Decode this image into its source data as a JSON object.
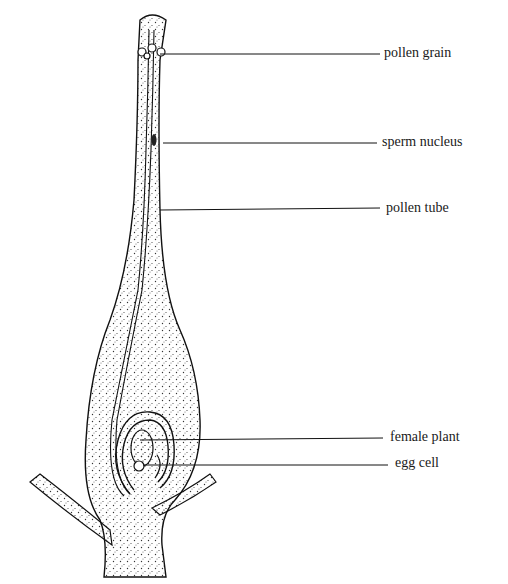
{
  "diagram": {
    "labels": [
      {
        "id": "pollen-grain",
        "text": "pollen grain",
        "x": 384,
        "y": 45,
        "line_from": [
          160,
          54
        ],
        "line_to": [
          380,
          54
        ]
      },
      {
        "id": "sperm-nucleus",
        "text": "sperm nucleus",
        "x": 382,
        "y": 134,
        "line_from": [
          163,
          143
        ],
        "line_to": [
          377,
          143
        ]
      },
      {
        "id": "pollen-tube",
        "text": "pollen tube",
        "x": 386,
        "y": 200,
        "line_from": [
          160,
          210
        ],
        "line_to": [
          380,
          208
        ]
      },
      {
        "id": "female-plant",
        "text": "female plant",
        "x": 390,
        "y": 429,
        "line_from": [
          140,
          440
        ],
        "line_to": [
          383,
          438
        ]
      },
      {
        "id": "egg-cell",
        "text": "egg cell",
        "x": 395,
        "y": 455,
        "line_from": [
          143,
          465
        ],
        "line_to": [
          388,
          465
        ]
      }
    ]
  }
}
